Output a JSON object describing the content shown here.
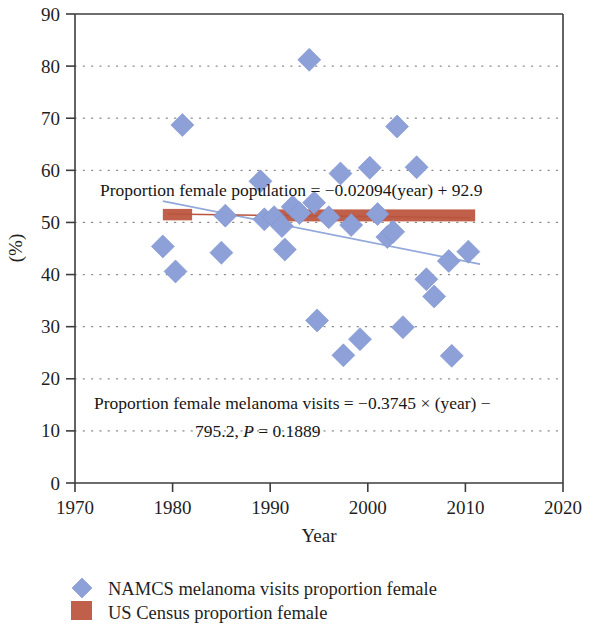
{
  "chart_data": {
    "type": "scatter",
    "title": "",
    "xlabel": "Year",
    "ylabel": "(%)",
    "xlim": [
      1970,
      2020
    ],
    "ylim": [
      0,
      90
    ],
    "xticks": [
      "1970",
      "1980",
      "1990",
      "2000",
      "2010",
      "2020"
    ],
    "xtick_values": [
      1970,
      1980,
      1990,
      2000,
      2010,
      2020
    ],
    "yticks": [
      "0",
      "10",
      "20",
      "30",
      "40",
      "50",
      "60",
      "70",
      "80",
      "90"
    ],
    "ytick_values": [
      0,
      10,
      20,
      30,
      40,
      50,
      60,
      70,
      80,
      90
    ],
    "grid": true,
    "grid_axis": "y",
    "legend_position": "below",
    "series": [
      {
        "name": "NAMCS melanoma visits proportion female",
        "type": "scatter",
        "marker": "diamond",
        "color": "#8da0d8",
        "points": [
          {
            "x": 1979.0,
            "y": 45.4
          },
          {
            "x": 1980.3,
            "y": 40.6
          },
          {
            "x": 1981.0,
            "y": 68.7
          },
          {
            "x": 1985.0,
            "y": 44.2
          },
          {
            "x": 1985.4,
            "y": 51.3
          },
          {
            "x": 1989.0,
            "y": 57.9
          },
          {
            "x": 1989.4,
            "y": 50.6
          },
          {
            "x": 1990.4,
            "y": 51.0
          },
          {
            "x": 1991.2,
            "y": 49.3
          },
          {
            "x": 1991.5,
            "y": 44.8
          },
          {
            "x": 1992.3,
            "y": 53.0
          },
          {
            "x": 1993.0,
            "y": 51.8
          },
          {
            "x": 1994.0,
            "y": 81.2
          },
          {
            "x": 1994.5,
            "y": 53.8
          },
          {
            "x": 1994.8,
            "y": 31.2
          },
          {
            "x": 1996.0,
            "y": 51.0
          },
          {
            "x": 1997.2,
            "y": 59.4
          },
          {
            "x": 1997.5,
            "y": 24.5
          },
          {
            "x": 1998.3,
            "y": 49.5
          },
          {
            "x": 1999.2,
            "y": 27.6
          },
          {
            "x": 2000.2,
            "y": 60.5
          },
          {
            "x": 2001.0,
            "y": 51.6
          },
          {
            "x": 2002.0,
            "y": 47.2
          },
          {
            "x": 2002.6,
            "y": 48.2
          },
          {
            "x": 2003.0,
            "y": 68.4
          },
          {
            "x": 2003.6,
            "y": 29.9
          },
          {
            "x": 2005.0,
            "y": 60.6
          },
          {
            "x": 2006.0,
            "y": 39.1
          },
          {
            "x": 2006.8,
            "y": 35.8
          },
          {
            "x": 2008.3,
            "y": 42.6
          },
          {
            "x": 2008.6,
            "y": 24.4
          },
          {
            "x": 2010.3,
            "y": 44.4
          }
        ]
      },
      {
        "name": "US Census proportion female",
        "type": "bar-band",
        "color": "#c0604a",
        "segments": [
          {
            "x_start": 1979.0,
            "x_end": 1982.0,
            "y_low": 50.4,
            "y_high": 52.6
          },
          {
            "x_start": 1990.0,
            "x_end": 2011.0,
            "y_low": 50.2,
            "y_high": 52.5
          }
        ]
      }
    ],
    "trendlines": [
      {
        "name": "melanoma-visits-trend",
        "color": "#93a9da",
        "x_start": 1979.0,
        "y_start": 54.1,
        "x_end": 2011.5,
        "y_end": 42.0
      },
      {
        "name": "census-trend",
        "color": "#b8553f",
        "x_start": 1979.5,
        "y_start": 51.6,
        "x_end": 2010.5,
        "y_end": 50.9
      }
    ],
    "annotations": [
      {
        "name": "population-equation",
        "lines": [
          "Proportion female population = −0.02094(year) + 92.9"
        ],
        "x": 1983.5,
        "y": 55.5
      },
      {
        "name": "melanoma-equation",
        "lines": [
          "Proportion female melanoma visits = −0.3745 × (year) −",
          "795.2, P = 0.1889"
        ],
        "x": 1983.5,
        "y": 15.5
      }
    ]
  },
  "axes": {
    "x_title": "Year",
    "y_title": "(%)",
    "x_tick_labels": [
      "1970",
      "1980",
      "1990",
      "2000",
      "2010",
      "2020"
    ],
    "y_tick_labels": [
      "90",
      "80",
      "70",
      "60",
      "50",
      "40",
      "30",
      "20",
      "10",
      "0"
    ]
  },
  "annotations": {
    "population_equation": "Proportion female population = −0.02094(year) + 92.9",
    "melanoma_equation_line1": "Proportion female melanoma visits = −0.3745 × (year) −",
    "melanoma_equation_line2_pre": "795.2, ",
    "melanoma_equation_line2_p": "P",
    "melanoma_equation_line2_post": " = 0.1889"
  },
  "legend": {
    "items": [
      {
        "label": "NAMCS melanoma visits proportion female",
        "marker": "diamond",
        "color": "#8da0d8"
      },
      {
        "label": "US Census proportion female",
        "marker": "square",
        "color": "#c0604a"
      }
    ]
  },
  "colors": {
    "marker_blue": "#8da0d8",
    "census_red": "#c0604a",
    "trend_blue": "#93a9da",
    "trend_red": "#b8553f",
    "axis": "#3d3d3d",
    "grid": "#8a8a8a"
  }
}
